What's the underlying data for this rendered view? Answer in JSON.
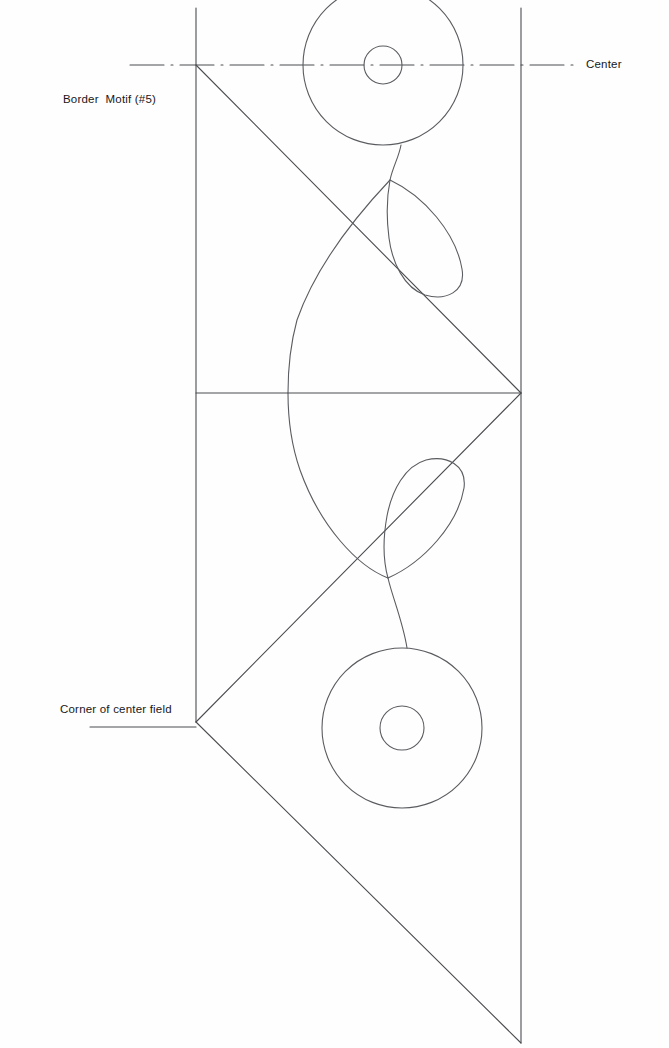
{
  "page": {
    "width": 669,
    "height": 1048,
    "background_color": "#fefefe",
    "line_color": "#4a4c50",
    "text_color": "#17181a"
  },
  "labels": {
    "center": "Center",
    "border_motif": "Border  Motif (#5)",
    "corner_of_center_field": "Corner of center field"
  },
  "construction_lines": {
    "center_axis": {
      "name": "center-axis-line",
      "style": "dash-dot",
      "y": 65,
      "x_start": 130,
      "x_end": 578
    },
    "left_vertical": {
      "name": "left-vertical-guide",
      "x": 196,
      "y_start": 8,
      "y_end": 722
    },
    "right_vertical": {
      "name": "right-vertical-guide",
      "x": 521,
      "y_start": 8,
      "y_end": 1043
    },
    "mid_horizontal": {
      "name": "mid-horizontal-guide",
      "y": 393,
      "x_start": 196,
      "x_end": 521
    },
    "diagonal_upper": {
      "name": "upper-diagonal",
      "x1": 196,
      "y1": 65,
      "x2": 521,
      "y2": 393
    },
    "diagonal_mid": {
      "name": "mid-diagonal",
      "x1": 521,
      "y1": 393,
      "x2": 196,
      "y2": 722
    },
    "diagonal_lower": {
      "name": "lower-diagonal",
      "x1": 196,
      "y1": 722,
      "x2": 521,
      "y2": 1043
    },
    "leader_corner": {
      "name": "corner-leader-line",
      "x1": 90,
      "y1": 727,
      "x2": 196,
      "y2": 727
    }
  },
  "motif": {
    "upper_rosette": {
      "name": "upper-rosette",
      "cx": 383,
      "cy": 65,
      "outer_r": 80,
      "inner_r": 19
    },
    "lower_rosette": {
      "name": "lower-rosette",
      "cx": 402,
      "cy": 728,
      "outer_r": 80,
      "inner_r": 22
    },
    "upper_stem": {
      "name": "upper-stem",
      "from_y": 145,
      "to_y": 180
    },
    "lower_stem": {
      "name": "lower-stem",
      "from_y": 578,
      "to_y": 648
    },
    "upper_petal": {
      "name": "upper-petal",
      "tip_x": 390,
      "tip_y": 180
    },
    "lower_petal": {
      "name": "lower-petal",
      "tip_x": 388,
      "tip_y": 578
    },
    "central_lens": {
      "name": "central-lens",
      "left_x": 288,
      "mid_y": 393
    }
  }
}
